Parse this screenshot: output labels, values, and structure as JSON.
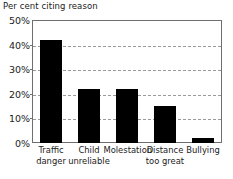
{
  "chart_data": {
    "type": "bar",
    "title": "Per cent citing reason",
    "xlabel": "",
    "ylabel": "",
    "categories": [
      "Traffic danger",
      "Child unreliable",
      "Molestation",
      "Distance too great",
      "Bullying"
    ],
    "category_lines": [
      [
        "Traffic",
        "danger"
      ],
      [
        "Child",
        "unreliable"
      ],
      [
        "Molestation"
      ],
      [
        "Distance",
        "too great"
      ],
      [
        "Bullying"
      ]
    ],
    "values": [
      42,
      22,
      22,
      15,
      2
    ],
    "ylim": [
      0,
      50
    ],
    "ytick_values": [
      0,
      10,
      20,
      30,
      40,
      50
    ],
    "ytick_labels": [
      "0%",
      "10%",
      "20%",
      "30%",
      "40%",
      "50%"
    ],
    "grid": true,
    "grid_style": "dashed",
    "grid_color": "#9a9a9a",
    "bar_color": "#000000",
    "frame_color": "#6f6f6f",
    "legend": null,
    "legend_position": "none"
  }
}
